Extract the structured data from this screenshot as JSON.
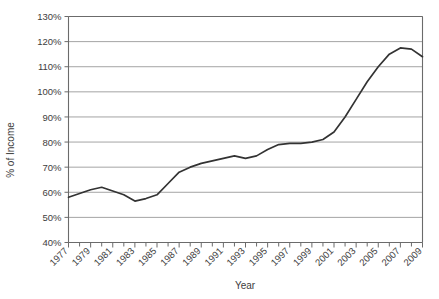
{
  "chart_data": {
    "type": "line",
    "title": "",
    "xlabel": "Year",
    "ylabel": "% of Income",
    "xlim": [
      1977,
      2009
    ],
    "ylim": [
      40,
      130
    ],
    "ytick_labels": [
      "130%",
      "120%",
      "110%",
      "100%",
      "90%",
      "80%",
      "70%",
      "60%",
      "50%",
      "40%"
    ],
    "ytick_values": [
      130,
      120,
      110,
      100,
      90,
      80,
      70,
      60,
      50,
      40
    ],
    "xtick_labels": [
      "1977",
      "1979",
      "1981",
      "1983",
      "1985",
      "1987",
      "1989",
      "1991",
      "1993",
      "1995",
      "1997",
      "1999",
      "2001",
      "2003",
      "2005",
      "2007",
      "2009"
    ],
    "xtick_values": [
      1977,
      1979,
      1981,
      1983,
      1985,
      1987,
      1989,
      1991,
      1993,
      1995,
      1997,
      1999,
      2001,
      2003,
      2005,
      2007,
      2009
    ],
    "grid": "horizontal",
    "legend": "none",
    "line_color": "#333333",
    "x": [
      1977,
      1978,
      1979,
      1980,
      1981,
      1982,
      1983,
      1984,
      1985,
      1986,
      1987,
      1988,
      1989,
      1990,
      1991,
      1992,
      1993,
      1994,
      1995,
      1996,
      1997,
      1998,
      1999,
      2000,
      2001,
      2002,
      2003,
      2004,
      2005,
      2006,
      2007,
      2008,
      2009
    ],
    "values": [
      58.0,
      59.5,
      61.0,
      62.0,
      60.5,
      59.0,
      56.5,
      57.5,
      59.0,
      63.5,
      68.0,
      70.0,
      71.5,
      72.5,
      73.5,
      74.5,
      73.5,
      74.5,
      77.0,
      79.0,
      79.5,
      79.5,
      80.0,
      81.0,
      84.0,
      90.0,
      97.0,
      104.0,
      110.0,
      115.0,
      117.5,
      117.0,
      114.0
    ],
    "series_name": "Household Debt as % of Income"
  }
}
